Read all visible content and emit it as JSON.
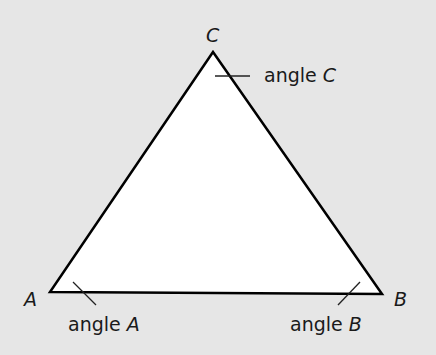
{
  "diagram": {
    "type": "triangle",
    "background": "#e6e6e6",
    "fill": "#ffffff",
    "stroke": "#000000",
    "vertices": {
      "A": {
        "label": "A",
        "x": 50,
        "y": 292
      },
      "B": {
        "label": "B",
        "x": 382,
        "y": 294
      },
      "C": {
        "label": "C",
        "x": 213,
        "y": 52
      }
    },
    "angle_labels": {
      "A": {
        "word": "angle",
        "letter": "A"
      },
      "B": {
        "word": "angle",
        "letter": "B"
      },
      "C": {
        "word": "angle",
        "letter": "C"
      }
    }
  }
}
